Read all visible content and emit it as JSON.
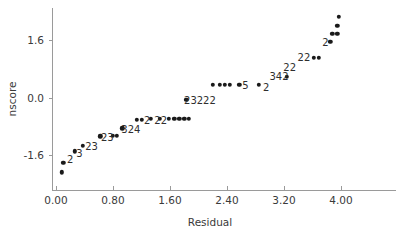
{
  "chart_data": {
    "type": "scatter",
    "title": "",
    "xlabel": "Residual",
    "ylabel": "nscore",
    "xlim": [
      -0.25,
      4.7
    ],
    "ylim": [
      -2.35,
      2.35
    ],
    "grid": false,
    "legend": null,
    "xticks": [
      "0.00",
      "0.80",
      "1.60",
      "2.40",
      "3.20",
      "4.00"
    ],
    "xtick_values": [
      0.0,
      0.8,
      1.6,
      2.4,
      3.2,
      4.0
    ],
    "yticks": [
      "1.6",
      "0.0",
      "-1.6"
    ],
    "ytick_values": [
      1.6,
      0.0,
      -1.6
    ],
    "points": [
      {
        "x": 0.08,
        "y": -2.08
      },
      {
        "x": 0.1,
        "y": -1.82
      },
      {
        "x": 0.26,
        "y": -1.5
      },
      {
        "x": 0.38,
        "y": -1.35
      },
      {
        "x": 0.62,
        "y": -1.08
      },
      {
        "x": 0.8,
        "y": -1.07
      },
      {
        "x": 0.85,
        "y": -1.07
      },
      {
        "x": 0.93,
        "y": -0.86
      },
      {
        "x": 1.13,
        "y": -0.62
      },
      {
        "x": 1.2,
        "y": -0.62
      },
      {
        "x": 1.33,
        "y": -0.6
      },
      {
        "x": 1.46,
        "y": -0.6
      },
      {
        "x": 1.58,
        "y": -0.6
      },
      {
        "x": 1.66,
        "y": -0.6
      },
      {
        "x": 1.73,
        "y": -0.6
      },
      {
        "x": 1.8,
        "y": -0.6
      },
      {
        "x": 1.86,
        "y": -0.6
      },
      {
        "x": 1.83,
        "y": -0.07
      },
      {
        "x": 2.2,
        "y": 0.36
      },
      {
        "x": 2.3,
        "y": 0.36
      },
      {
        "x": 2.37,
        "y": 0.36
      },
      {
        "x": 2.44,
        "y": 0.36
      },
      {
        "x": 2.57,
        "y": 0.36
      },
      {
        "x": 2.85,
        "y": 0.36
      },
      {
        "x": 3.24,
        "y": 0.58
      },
      {
        "x": 3.62,
        "y": 1.11
      },
      {
        "x": 3.69,
        "y": 1.11
      },
      {
        "x": 3.85,
        "y": 1.55
      },
      {
        "x": 3.88,
        "y": 1.77
      },
      {
        "x": 3.95,
        "y": 1.77
      },
      {
        "x": 3.95,
        "y": 2.0
      },
      {
        "x": 3.97,
        "y": 2.25
      }
    ],
    "count_annotations": [
      {
        "label": "2",
        "x": 0.2,
        "y": -1.72
      },
      {
        "label": "3",
        "x": 0.33,
        "y": -1.55
      },
      {
        "label": "23",
        "x": 0.5,
        "y": -1.36
      },
      {
        "label": "23",
        "x": 0.72,
        "y": -1.09
      },
      {
        "label": "324",
        "x": 1.05,
        "y": -0.88
      },
      {
        "label": "2",
        "x": 1.28,
        "y": -0.62
      },
      {
        "label": "22",
        "x": 1.47,
        "y": -0.62
      },
      {
        "label": "23222",
        "x": 2.02,
        "y": -0.08
      },
      {
        "label": "5",
        "x": 2.66,
        "y": 0.36
      },
      {
        "label": "2",
        "x": 2.95,
        "y": 0.28
      },
      {
        "label": "342",
        "x": 3.13,
        "y": 0.6
      },
      {
        "label": "22",
        "x": 3.28,
        "y": 0.84
      },
      {
        "label": "22",
        "x": 3.48,
        "y": 1.12
      },
      {
        "label": "2",
        "x": 3.78,
        "y": 1.54
      }
    ]
  },
  "style": {
    "point_color": "#1a1a1a",
    "axis_color": "#9a9a9a",
    "text_color": "#3a3a3a",
    "background": "#ffffff"
  }
}
